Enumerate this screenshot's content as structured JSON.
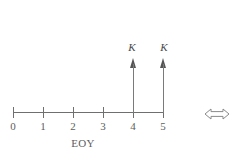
{
  "diagram": {
    "type": "cash-flow-timeline",
    "axis": {
      "label": "EOY",
      "tick_values": [
        "0",
        "1",
        "2",
        "3",
        "4",
        "5"
      ],
      "start": 0,
      "end": 5,
      "line_color": "#6f6f6f"
    },
    "cash_flows": [
      {
        "period": "4",
        "label": "K",
        "direction": "up"
      },
      {
        "period": "5",
        "label": "K",
        "direction": "up"
      }
    ],
    "equivalence": {
      "icon": "left-right-double-arrow-icon",
      "glyph": "⟺"
    }
  }
}
